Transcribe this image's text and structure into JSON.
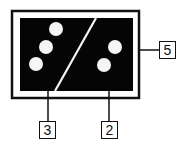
{
  "diagram": {
    "colors": {
      "frame": "#111111",
      "panel": "#050505",
      "dots": "#f5f5f5",
      "background": "#ffffff"
    },
    "halves": [
      {
        "side": "left",
        "dot_count": 3
      },
      {
        "side": "right",
        "dot_count": 2
      }
    ],
    "callouts": [
      {
        "id": "callout-3",
        "label": "3",
        "points_to": "left-half"
      },
      {
        "id": "callout-2",
        "label": "2",
        "points_to": "right-half"
      },
      {
        "id": "callout-5",
        "label": "5",
        "points_to": "outer-frame"
      }
    ]
  }
}
